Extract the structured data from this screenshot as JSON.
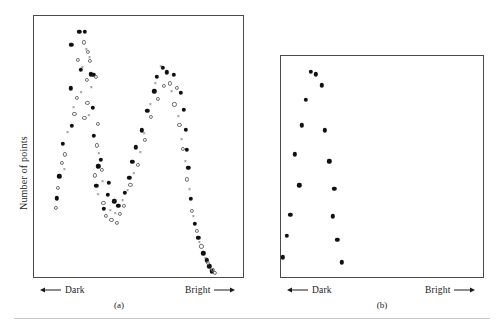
{
  "figure": {
    "y_axis_label": "Number of points",
    "dark_label": "Dark",
    "bright_label": "Bright",
    "left_arrow_icon": "left-arrow-icon",
    "right_arrow_icon": "right-arrow-icon"
  },
  "panel_a": {
    "caption": "(a)"
  },
  "panel_b": {
    "caption": "(b)"
  },
  "chart_data": [
    {
      "type": "scatter",
      "title": "(a)",
      "xlabel": "Dark ← → Bright",
      "ylabel": "Number of points",
      "xlim": [
        0,
        100
      ],
      "ylim": [
        0,
        100
      ],
      "grid": false,
      "legend": "none",
      "note": "Bimodal (two-peaked) distribution of point counts versus brightness; three overlaid marker series.",
      "series": [
        {
          "name": "filled-circle",
          "marker": "filled-circle",
          "points": [
            [
              22.0,
              93.5
            ],
            [
              24.6,
              93.6
            ],
            [
              18.2,
              88.6
            ],
            [
              22.6,
              79.2
            ],
            [
              27.3,
              77.4
            ],
            [
              28.6,
              77.2
            ],
            [
              17.9,
              72.2
            ],
            [
              28.2,
              64.8
            ],
            [
              18.5,
              57.9
            ],
            [
              28.8,
              54.0
            ],
            [
              14.1,
              51.0
            ],
            [
              32.0,
              45.0
            ],
            [
              31.0,
              42.5
            ],
            [
              12.4,
              38.7
            ],
            [
              30.0,
              35.0
            ],
            [
              11.3,
              30.3
            ],
            [
              36.0,
              36.2
            ],
            [
              35.5,
              31.6
            ],
            [
              38.5,
              29.1
            ],
            [
              33.6,
              26.4
            ],
            [
              40.4,
              27.4
            ],
            [
              43.4,
              32.4
            ],
            [
              45.6,
              38.2
            ],
            [
              47.0,
              44.2
            ],
            [
              48.6,
              49.7
            ],
            [
              51.5,
              56.1
            ],
            [
              54.2,
              63.6
            ],
            [
              57.4,
              71.0
            ],
            [
              58.6,
              76.4
            ],
            [
              61.4,
              79.9
            ],
            [
              63.3,
              78.2
            ],
            [
              66.8,
              77.2
            ],
            [
              70.0,
              70.5
            ],
            [
              71.6,
              63.9
            ],
            [
              72.5,
              56.3
            ],
            [
              72.8,
              48.8
            ],
            [
              73.6,
              41.9
            ],
            [
              74.8,
              30.2
            ],
            [
              76.6,
              20.6
            ],
            [
              78.4,
              15.3
            ],
            [
              80.8,
              9.4
            ],
            [
              82.4,
              6.7
            ],
            [
              83.6,
              4.4
            ],
            [
              84.6,
              2.6
            ]
          ]
        },
        {
          "name": "open-circle",
          "marker": "open-circle",
          "points": [
            [
              24.0,
              89.6
            ],
            [
              26.2,
              85.9
            ],
            [
              27.0,
              82.4
            ],
            [
              21.4,
              83.0
            ],
            [
              25.4,
              75.2
            ],
            [
              30.0,
              76.5
            ],
            [
              21.0,
              68.5
            ],
            [
              25.8,
              66.6
            ],
            [
              24.4,
              60.8
            ],
            [
              19.6,
              62.3
            ],
            [
              30.6,
              58.6
            ],
            [
              30.2,
              50.4
            ],
            [
              15.2,
              47.0
            ],
            [
              13.6,
              43.8
            ],
            [
              32.6,
              41.2
            ],
            [
              29.4,
              39.0
            ],
            [
              11.8,
              34.2
            ],
            [
              10.9,
              26.6
            ],
            [
              33.4,
              28.4
            ],
            [
              34.6,
              23.7
            ],
            [
              37.2,
              22.0
            ],
            [
              39.6,
              21.0
            ],
            [
              41.0,
              24.4
            ],
            [
              43.0,
              27.5
            ],
            [
              46.2,
              35.5
            ],
            [
              49.6,
              43.0
            ],
            [
              53.2,
              52.4
            ],
            [
              56.0,
              61.3
            ],
            [
              59.2,
              68.2
            ],
            [
              62.0,
              73.1
            ],
            [
              64.8,
              74.0
            ],
            [
              68.2,
              72.4
            ],
            [
              67.0,
              66.0
            ],
            [
              69.4,
              58.2
            ],
            [
              71.0,
              49.0
            ],
            [
              73.0,
              37.5
            ],
            [
              75.4,
              25.4
            ],
            [
              77.6,
              17.8
            ],
            [
              79.8,
              12.0
            ],
            [
              82.8,
              5.8
            ],
            [
              85.2,
              3.2
            ],
            [
              86.4,
              1.9
            ]
          ]
        },
        {
          "name": "cross",
          "marker": "cross",
          "points": [
            [
              25.2,
              87.2
            ],
            [
              26.8,
              84.0
            ],
            [
              23.4,
              80.4
            ],
            [
              27.6,
              72.8
            ],
            [
              22.8,
              70.6
            ],
            [
              19.2,
              65.1
            ],
            [
              26.4,
              62.0
            ],
            [
              16.4,
              55.4
            ],
            [
              31.2,
              47.6
            ],
            [
              14.8,
              41.4
            ],
            [
              33.0,
              36.8
            ],
            [
              30.8,
              31.8
            ],
            [
              36.6,
              26.0
            ],
            [
              39.0,
              24.6
            ],
            [
              42.4,
              29.8
            ],
            [
              44.8,
              33.6
            ],
            [
              47.8,
              40.0
            ],
            [
              50.8,
              47.8
            ],
            [
              52.6,
              55.0
            ],
            [
              55.6,
              66.0
            ],
            [
              58.0,
              74.2
            ],
            [
              60.6,
              80.6
            ],
            [
              65.6,
              71.0
            ],
            [
              68.8,
              61.6
            ],
            [
              70.4,
              53.0
            ],
            [
              72.2,
              44.6
            ],
            [
              74.2,
              34.0
            ],
            [
              76.0,
              23.4
            ],
            [
              78.8,
              13.6
            ],
            [
              81.6,
              7.6
            ],
            [
              84.0,
              3.6
            ]
          ]
        }
      ]
    },
    {
      "type": "scatter",
      "title": "(b)",
      "xlabel": "Dark ← → Bright",
      "ylabel": "Number of points",
      "xlim": [
        0,
        100
      ],
      "ylim": [
        0,
        100
      ],
      "grid": false,
      "legend": "none",
      "note": "Unimodal distribution; single filled-circle series forming two descending arms from a single peak near the dark end.",
      "series": [
        {
          "name": "filled-circle",
          "marker": "filled-circle",
          "points": [
            [
              15.2,
              92.6
            ],
            [
              17.6,
              91.4
            ],
            [
              20.4,
              86.4
            ],
            [
              12.6,
              80.0
            ],
            [
              10.8,
              68.4
            ],
            [
              22.0,
              66.2
            ],
            [
              7.2,
              55.4
            ],
            [
              24.2,
              52.4
            ],
            [
              9.4,
              41.6
            ],
            [
              26.6,
              40.0
            ],
            [
              5.0,
              28.4
            ],
            [
              26.0,
              27.6
            ],
            [
              3.2,
              18.8
            ],
            [
              28.0,
              17.0
            ],
            [
              1.4,
              9.2
            ],
            [
              30.2,
              7.0
            ]
          ]
        }
      ]
    }
  ]
}
